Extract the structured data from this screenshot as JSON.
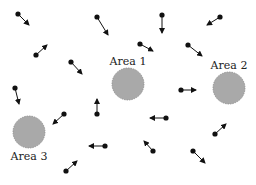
{
  "diagram": {
    "width": 256,
    "height": 185,
    "colors": {
      "background": "#ffffff",
      "area_fill": "#a9a9a9",
      "area_stroke": "#8a8a8a",
      "agent": "#111111"
    },
    "areas": [
      {
        "label": "Area 1",
        "cx": 128,
        "cy": 84,
        "r": 16,
        "label_x": 128,
        "label_y": 65
      },
      {
        "label": "Area 2",
        "cx": 229,
        "cy": 88,
        "r": 16,
        "label_x": 229,
        "label_y": 69
      },
      {
        "label": "Area 3",
        "cx": 29,
        "cy": 132,
        "r": 16,
        "label_x": 29,
        "label_y": 160
      }
    ],
    "agents": [
      {
        "x": 18,
        "y": 14,
        "tx": 29,
        "ty": 25
      },
      {
        "x": 36,
        "y": 55,
        "tx": 47,
        "ty": 45
      },
      {
        "x": 71,
        "y": 62,
        "tx": 82,
        "ty": 74
      },
      {
        "x": 97,
        "y": 17,
        "tx": 108,
        "ty": 35
      },
      {
        "x": 15,
        "y": 88,
        "tx": 19,
        "ty": 104
      },
      {
        "x": 162,
        "y": 15,
        "tx": 162,
        "ty": 33
      },
      {
        "x": 220,
        "y": 17,
        "tx": 207,
        "ty": 25
      },
      {
        "x": 140,
        "y": 44,
        "tx": 153,
        "ty": 51
      },
      {
        "x": 188,
        "y": 45,
        "tx": 202,
        "ty": 56
      },
      {
        "x": 64,
        "y": 114,
        "tx": 53,
        "ty": 124
      },
      {
        "x": 97,
        "y": 114,
        "tx": 97,
        "ty": 99
      },
      {
        "x": 181,
        "y": 90,
        "tx": 196,
        "ty": 90
      },
      {
        "x": 105,
        "y": 146,
        "tx": 89,
        "ty": 146
      },
      {
        "x": 166,
        "y": 118,
        "tx": 150,
        "ty": 118
      },
      {
        "x": 66,
        "y": 171,
        "tx": 77,
        "ty": 161
      },
      {
        "x": 215,
        "y": 134,
        "tx": 226,
        "ty": 124
      },
      {
        "x": 153,
        "y": 151,
        "tx": 144,
        "ty": 141
      },
      {
        "x": 193,
        "y": 151,
        "tx": 205,
        "ty": 163
      }
    ]
  }
}
